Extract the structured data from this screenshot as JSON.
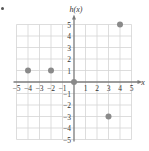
{
  "chart_data": {
    "type": "scatter",
    "title": "",
    "xlabel": "x",
    "ylabel": "h(x)",
    "xlim": [
      -5,
      5
    ],
    "ylim": [
      -5,
      5
    ],
    "grid": true,
    "x_ticks": [
      "−5",
      "−4",
      "−3",
      "−2",
      "−1",
      "1",
      "2",
      "3",
      "4",
      "5"
    ],
    "y_ticks": [
      "5",
      "4",
      "3",
      "2",
      "1",
      "−1",
      "−2",
      "−3",
      "−4",
      "−5"
    ],
    "series": [
      {
        "name": "h(x)",
        "points": [
          {
            "x": -4,
            "y": 1
          },
          {
            "x": -2,
            "y": 1
          },
          {
            "x": 0,
            "y": 0
          },
          {
            "x": 3,
            "y": -3
          },
          {
            "x": 4,
            "y": 5
          }
        ]
      }
    ]
  },
  "colors": {
    "grid": "#d4d4d4",
    "axis": "#7a7a7a",
    "point": "#8a8a8a",
    "text": "#333333"
  }
}
